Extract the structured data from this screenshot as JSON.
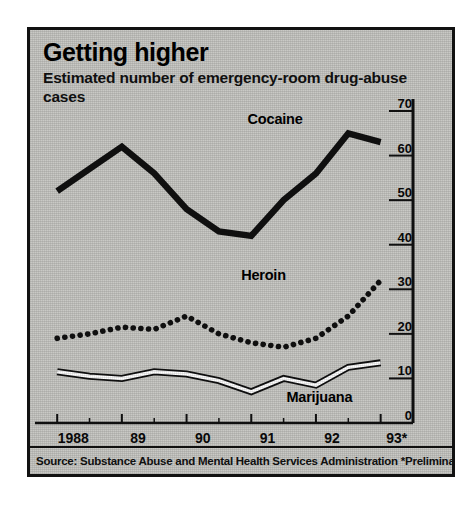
{
  "chart_data": {
    "type": "line",
    "title": "Getting higher",
    "subtitle": "Estimated number of emergency-room drug-abuse cases",
    "xlabel": "",
    "ylabel": "",
    "ylim": [
      0,
      70
    ],
    "yticks": [
      0,
      10,
      20,
      30,
      40,
      50,
      60,
      70
    ],
    "xlim": [
      1987.75,
      1993.5
    ],
    "xticks": [
      1988,
      1989,
      1990,
      1991,
      1992,
      1993
    ],
    "xticklabels": [
      "1988",
      "89",
      "90",
      "91",
      "92",
      "93*"
    ],
    "grid": false,
    "legend_position": "inline-annotations",
    "note": "Values in thousands of emergency-room cases; x positions are half-year steps",
    "x": [
      1988.0,
      1988.5,
      1989.0,
      1989.5,
      1990.0,
      1990.5,
      1991.0,
      1991.5,
      1992.0,
      1992.5,
      1993.0
    ],
    "series": [
      {
        "name": "Cocaine",
        "style": "thick-solid-black",
        "color": "#111111",
        "values": [
          52,
          57,
          62,
          56,
          48,
          43,
          42,
          50,
          56,
          65,
          63
        ]
      },
      {
        "name": "Heroin",
        "style": "dotted-black",
        "color": "#111111",
        "values": [
          19,
          20,
          21.5,
          21,
          24,
          20,
          18,
          17,
          19,
          24,
          32
        ]
      },
      {
        "name": "Marijuana",
        "style": "white-line-black-outline",
        "color": "#ffffff",
        "values": [
          11.5,
          10.5,
          10,
          11.5,
          11,
          9.5,
          7,
          10,
          8.5,
          12.5,
          13.5
        ]
      }
    ],
    "annotations": [
      {
        "text": "Cocaine",
        "x": 1991.5,
        "y": 68
      },
      {
        "text": "Heroin",
        "x": 1991.4,
        "y": 33
      },
      {
        "text": "Marijuana",
        "x": 1992.1,
        "y": 5.5
      }
    ]
  },
  "source": {
    "text": "Source: Substance Abuse and Mental Health Services Administration *Preliminary"
  },
  "colors": {
    "panel_background": "#c9c9c5",
    "ink": "#111111",
    "marijuana_fill": "#ffffff"
  }
}
